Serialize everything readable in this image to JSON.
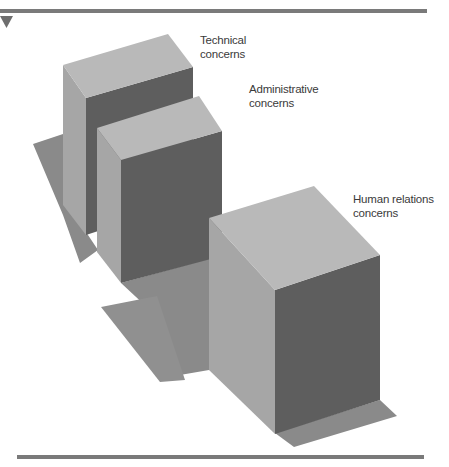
{
  "figure": {
    "labels": {
      "technical": {
        "line1": "Technical",
        "line2": "concerns"
      },
      "administrative": {
        "line1": "Administrative",
        "line2": "concerns"
      },
      "human_relations": {
        "line1": "Human relations",
        "line2": "concerns"
      }
    },
    "colors": {
      "rule": "#7a7a7a",
      "marker": "#6e6e6e",
      "top_face": "#b9b9b9",
      "left_face": "#a6a6a6",
      "front_face": "#5e5e5e",
      "shadow": "#8a8a8a",
      "text": "#3a3a3a"
    }
  }
}
